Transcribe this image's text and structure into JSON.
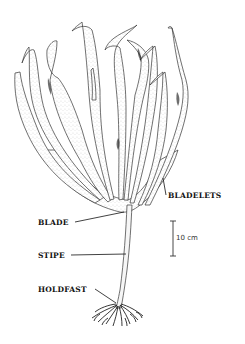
{
  "figure": {
    "labels": {
      "bladelets": "BLADELETS",
      "blade": "BLADE",
      "stipe": "STIPE",
      "holdfast": "HOLDFAST"
    },
    "scale_bar": {
      "text": "10 cm"
    },
    "colors": {
      "ink": "#111111",
      "stipple": "#555555",
      "background": "#ffffff"
    }
  }
}
